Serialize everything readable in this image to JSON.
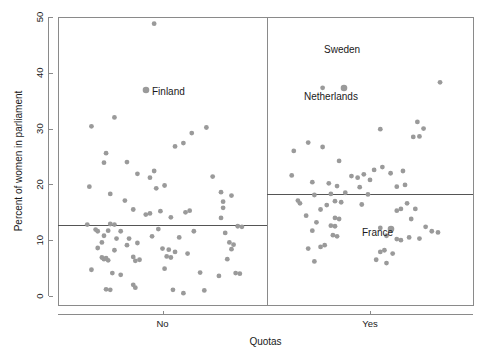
{
  "chart_data": {
    "type": "scatter",
    "title": "",
    "subtitle": "",
    "xlabel": "Quotas",
    "ylabel": "Percent of women in parliament",
    "xcategories": [
      "No",
      "Yes"
    ],
    "yticks": [
      0,
      10,
      20,
      30,
      40,
      50
    ],
    "ylim": [
      0,
      50
    ],
    "grid": false,
    "legend": "none",
    "group_mean_lines": [
      {
        "group": "No",
        "value": 12.7
      },
      {
        "group": "Yes",
        "value": 18.3
      }
    ],
    "annotations": [
      {
        "text": "Finland",
        "group": "No",
        "value": 36.9
      },
      {
        "text": "Sweden",
        "group": "Yes",
        "value": 45.3
      },
      {
        "text": "Netherlands",
        "group": "Yes",
        "value": 37.3
      },
      {
        "text": "France",
        "group": "Yes",
        "value": 12.2
      }
    ],
    "series": [
      {
        "name": "No",
        "points": [
          {
            "jx": 0.46,
            "y": 48.8
          },
          {
            "jx": 0.42,
            "y": 36.9
          },
          {
            "jx": 0.27,
            "y": 32.0
          },
          {
            "jx": 0.16,
            "y": 30.4
          },
          {
            "jx": 0.71,
            "y": 30.2
          },
          {
            "jx": 0.64,
            "y": 29.2
          },
          {
            "jx": 0.56,
            "y": 26.8
          },
          {
            "jx": 0.6,
            "y": 27.4
          },
          {
            "jx": 0.23,
            "y": 25.6
          },
          {
            "jx": 0.33,
            "y": 24.0
          },
          {
            "jx": 0.22,
            "y": 23.9
          },
          {
            "jx": 0.74,
            "y": 21.4
          },
          {
            "jx": 0.46,
            "y": 22.4
          },
          {
            "jx": 0.38,
            "y": 21.9
          },
          {
            "jx": 0.44,
            "y": 21.2
          },
          {
            "jx": 0.15,
            "y": 19.6
          },
          {
            "jx": 0.51,
            "y": 19.8
          },
          {
            "jx": 0.47,
            "y": 19.3
          },
          {
            "jx": 0.78,
            "y": 18.6
          },
          {
            "jx": 0.83,
            "y": 18.0
          },
          {
            "jx": 0.25,
            "y": 18.3
          },
          {
            "jx": 0.79,
            "y": 16.9
          },
          {
            "jx": 0.32,
            "y": 17.1
          },
          {
            "jx": 0.79,
            "y": 15.8
          },
          {
            "jx": 0.36,
            "y": 15.5
          },
          {
            "jx": 0.61,
            "y": 15.0
          },
          {
            "jx": 0.63,
            "y": 15.3
          },
          {
            "jx": 0.42,
            "y": 14.6
          },
          {
            "jx": 0.44,
            "y": 14.8
          },
          {
            "jx": 0.49,
            "y": 15.2
          },
          {
            "jx": 0.54,
            "y": 14.1
          },
          {
            "jx": 0.78,
            "y": 14.0
          },
          {
            "jx": 0.14,
            "y": 12.8
          },
          {
            "jx": 0.25,
            "y": 12.9
          },
          {
            "jx": 0.27,
            "y": 12.8
          },
          {
            "jx": 0.86,
            "y": 12.5
          },
          {
            "jx": 0.88,
            "y": 12.4
          },
          {
            "jx": 0.18,
            "y": 11.9
          },
          {
            "jx": 0.19,
            "y": 11.6
          },
          {
            "jx": 0.24,
            "y": 11.7
          },
          {
            "jx": 0.3,
            "y": 11.6
          },
          {
            "jx": 0.48,
            "y": 12.0
          },
          {
            "jx": 0.65,
            "y": 11.6
          },
          {
            "jx": 0.8,
            "y": 11.3
          },
          {
            "jx": 0.22,
            "y": 10.8
          },
          {
            "jx": 0.28,
            "y": 10.3
          },
          {
            "jx": 0.34,
            "y": 10.3
          },
          {
            "jx": 0.45,
            "y": 10.7
          },
          {
            "jx": 0.58,
            "y": 10.5
          },
          {
            "jx": 0.21,
            "y": 9.6
          },
          {
            "jx": 0.33,
            "y": 9.1
          },
          {
            "jx": 0.38,
            "y": 9.5
          },
          {
            "jx": 0.82,
            "y": 9.6
          },
          {
            "jx": 0.84,
            "y": 9.2
          },
          {
            "jx": 0.19,
            "y": 8.6
          },
          {
            "jx": 0.27,
            "y": 8.2
          },
          {
            "jx": 0.5,
            "y": 8.5
          },
          {
            "jx": 0.53,
            "y": 8.3
          },
          {
            "jx": 0.56,
            "y": 7.9
          },
          {
            "jx": 0.62,
            "y": 7.6
          },
          {
            "jx": 0.83,
            "y": 8.4
          },
          {
            "jx": 0.21,
            "y": 6.9
          },
          {
            "jx": 0.22,
            "y": 6.6
          },
          {
            "jx": 0.23,
            "y": 6.8
          },
          {
            "jx": 0.24,
            "y": 6.4
          },
          {
            "jx": 0.36,
            "y": 7.0
          },
          {
            "jx": 0.37,
            "y": 6.3
          },
          {
            "jx": 0.39,
            "y": 6.5
          },
          {
            "jx": 0.52,
            "y": 7.1
          },
          {
            "jx": 0.54,
            "y": 6.9
          },
          {
            "jx": 0.81,
            "y": 6.6
          },
          {
            "jx": 0.16,
            "y": 4.7
          },
          {
            "jx": 0.26,
            "y": 4.1
          },
          {
            "jx": 0.3,
            "y": 3.8
          },
          {
            "jx": 0.51,
            "y": 4.9
          },
          {
            "jx": 0.68,
            "y": 4.2
          },
          {
            "jx": 0.77,
            "y": 3.6
          },
          {
            "jx": 0.85,
            "y": 4.1
          },
          {
            "jx": 0.87,
            "y": 4.0
          },
          {
            "jx": 0.23,
            "y": 1.2
          },
          {
            "jx": 0.25,
            "y": 1.1
          },
          {
            "jx": 0.36,
            "y": 2.0
          },
          {
            "jx": 0.37,
            "y": 1.5
          },
          {
            "jx": 0.55,
            "y": 1.1
          },
          {
            "jx": 0.6,
            "y": 0.5
          },
          {
            "jx": 0.7,
            "y": 1.0
          }
        ]
      },
      {
        "name": "Yes",
        "points": [
          {
            "jx": 0.27,
            "y": 37.3
          },
          {
            "jx": 0.84,
            "y": 38.3
          },
          {
            "jx": 0.73,
            "y": 31.2
          },
          {
            "jx": 0.76,
            "y": 30.0
          },
          {
            "jx": 0.55,
            "y": 29.9
          },
          {
            "jx": 0.71,
            "y": 28.5
          },
          {
            "jx": 0.74,
            "y": 28.6
          },
          {
            "jx": 0.2,
            "y": 27.5
          },
          {
            "jx": 0.27,
            "y": 26.7
          },
          {
            "jx": 0.13,
            "y": 26.0
          },
          {
            "jx": 0.35,
            "y": 24.2
          },
          {
            "jx": 0.56,
            "y": 23.1
          },
          {
            "jx": 0.52,
            "y": 22.6
          },
          {
            "jx": 0.6,
            "y": 22.0
          },
          {
            "jx": 0.66,
            "y": 22.4
          },
          {
            "jx": 0.12,
            "y": 21.6
          },
          {
            "jx": 0.41,
            "y": 21.5
          },
          {
            "jx": 0.44,
            "y": 21.2
          },
          {
            "jx": 0.47,
            "y": 21.8
          },
          {
            "jx": 0.5,
            "y": 20.8
          },
          {
            "jx": 0.22,
            "y": 20.4
          },
          {
            "jx": 0.3,
            "y": 20.2
          },
          {
            "jx": 0.34,
            "y": 19.7
          },
          {
            "jx": 0.45,
            "y": 19.5
          },
          {
            "jx": 0.63,
            "y": 19.6
          },
          {
            "jx": 0.67,
            "y": 19.9
          },
          {
            "jx": 0.31,
            "y": 18.3
          },
          {
            "jx": 0.38,
            "y": 18.5
          },
          {
            "jx": 0.23,
            "y": 18.1
          },
          {
            "jx": 0.49,
            "y": 18.2
          },
          {
            "jx": 0.15,
            "y": 17.1
          },
          {
            "jx": 0.16,
            "y": 16.6
          },
          {
            "jx": 0.33,
            "y": 17.0
          },
          {
            "jx": 0.36,
            "y": 16.8
          },
          {
            "jx": 0.29,
            "y": 16.3
          },
          {
            "jx": 0.46,
            "y": 16.4
          },
          {
            "jx": 0.68,
            "y": 16.6
          },
          {
            "jx": 0.26,
            "y": 15.5
          },
          {
            "jx": 0.63,
            "y": 15.3
          },
          {
            "jx": 0.65,
            "y": 15.6
          },
          {
            "jx": 0.72,
            "y": 15.6
          },
          {
            "jx": 0.19,
            "y": 14.4
          },
          {
            "jx": 0.33,
            "y": 14.0
          },
          {
            "jx": 0.35,
            "y": 13.8
          },
          {
            "jx": 0.24,
            "y": 13.2
          },
          {
            "jx": 0.7,
            "y": 13.8
          },
          {
            "jx": 0.31,
            "y": 12.6
          },
          {
            "jx": 0.33,
            "y": 12.5
          },
          {
            "jx": 0.55,
            "y": 12.2
          },
          {
            "jx": 0.77,
            "y": 12.4
          },
          {
            "jx": 0.22,
            "y": 11.7
          },
          {
            "jx": 0.8,
            "y": 11.6
          },
          {
            "jx": 0.83,
            "y": 11.4
          },
          {
            "jx": 0.32,
            "y": 10.9
          },
          {
            "jx": 0.34,
            "y": 10.7
          },
          {
            "jx": 0.58,
            "y": 10.8
          },
          {
            "jx": 0.69,
            "y": 10.5
          },
          {
            "jx": 0.63,
            "y": 10.2
          },
          {
            "jx": 0.65,
            "y": 10.0
          },
          {
            "jx": 0.74,
            "y": 10.3
          },
          {
            "jx": 0.28,
            "y": 9.1
          },
          {
            "jx": 0.26,
            "y": 8.8
          },
          {
            "jx": 0.2,
            "y": 8.5
          },
          {
            "jx": 0.57,
            "y": 8.2
          },
          {
            "jx": 0.55,
            "y": 7.9
          },
          {
            "jx": 0.61,
            "y": 7.6
          },
          {
            "jx": 0.23,
            "y": 6.2
          },
          {
            "jx": 0.53,
            "y": 6.5
          },
          {
            "jx": 0.58,
            "y": 5.9
          }
        ]
      }
    ]
  },
  "geometry": {
    "plot_left": 58,
    "plot_right": 473,
    "plot_top": 17,
    "plot_bottom": 305,
    "panel_divider": 267,
    "y_zero": 296,
    "px_per_unit": 5.58,
    "dot_radius": 2.4,
    "label_offsets": {
      "Finland": {
        "x": 152,
        "y": 95
      },
      "Sweden": {
        "x": 324,
        "y": 53
      },
      "Netherlands": {
        "x": 304,
        "y": 100
      },
      "France": {
        "x": 362,
        "y": 236
      }
    },
    "label_points": {
      "Finland": {
        "x": 146,
        "y": 90
      },
      "Netherlands": {
        "x": 344,
        "y": 88
      },
      "France": {
        "x": 391,
        "y": 229
      }
    }
  },
  "colors": {
    "point": "#9a9a9a",
    "axis": "#8a8a8a",
    "mean_line": "#555555",
    "text": "#1a1a1a",
    "background": "#ffffff"
  }
}
